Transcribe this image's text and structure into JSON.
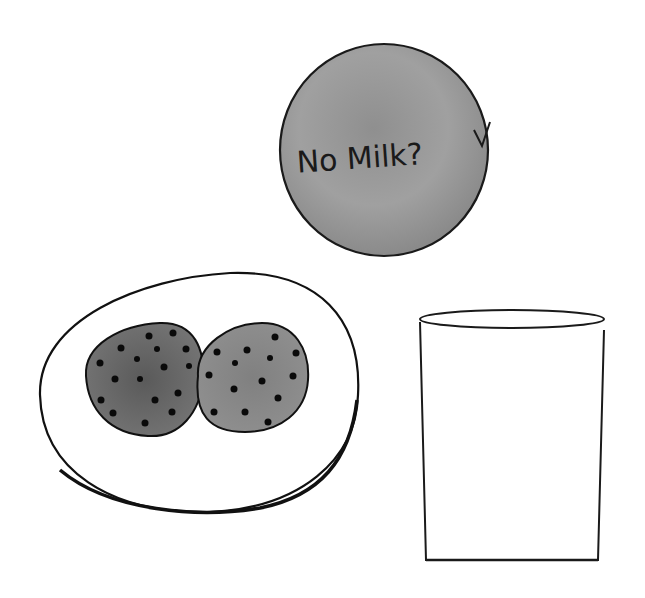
{
  "illustration": {
    "title": "Cookies and empty glass sketch",
    "bubble": {
      "text": "No Milk?",
      "fill": "#9a9a9a",
      "stroke": "#1a1a1a"
    },
    "plate": {
      "fill": "#ffffff",
      "stroke": "#111111",
      "cookies": [
        {
          "name": "left-cookie",
          "fill": "#6e6e6e"
        },
        {
          "name": "right-cookie",
          "fill": "#8a8a8a"
        }
      ],
      "chip_color": "#0a0a0a"
    },
    "glass": {
      "state": "empty",
      "fill": "#ffffff",
      "stroke": "#1a1a1a"
    },
    "background": "#ffffff"
  }
}
